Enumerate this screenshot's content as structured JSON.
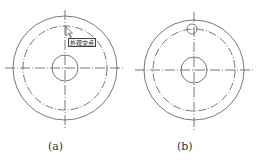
{
  "figures": [
    {
      "id": "a",
      "caption": "(a)",
      "tooltip": "外观交点",
      "center": [
        65,
        68
      ],
      "outer_radius": 52,
      "centerline_circle_radius": 42,
      "inner_radius": 13
    },
    {
      "id": "b",
      "caption": "(b)",
      "center": [
        194,
        70
      ],
      "outer_radius": 50,
      "centerline_circle_radius": 41,
      "inner_radius": 13,
      "small_hole": {
        "center": [
          192,
          29
        ],
        "radius": 5
      }
    }
  ],
  "colors": {
    "line": "#555555",
    "background": "#ffffff"
  }
}
